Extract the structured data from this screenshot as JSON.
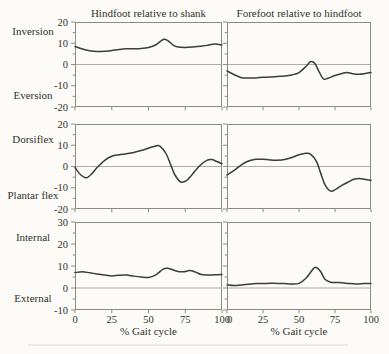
{
  "figure_title": "Foot segment kinematics across the gait cycle",
  "columns": [
    {
      "title": "Hindfoot relative to shank"
    },
    {
      "title": "Forefoot relative to hindfoot"
    }
  ],
  "rows": [
    {
      "top_label": "Inversion",
      "bottom_label": "Eversion"
    },
    {
      "top_label": "Dorsiflex",
      "bottom_label": "Plantar flex"
    },
    {
      "top_label": "Internal",
      "bottom_label": "External"
    }
  ],
  "xlabel": "% Gait cycle",
  "colors": {
    "background": "#fcfbf7",
    "axis_border": "#8d8a84",
    "zero_line": "#aeaba5",
    "series_line": "#3c3c3c",
    "text": "#33322f"
  },
  "chart_data": [
    {
      "id": "hindfoot-inversion-eversion",
      "type": "line",
      "title": "Hindfoot relative to shank — Inversion / Eversion",
      "row": 0,
      "col": 0,
      "xlabel": "% Gait cycle",
      "ylabel": "Inversion (+) / Eversion (−)",
      "xlim": [
        0,
        100
      ],
      "ylim": [
        -20,
        20
      ],
      "xticks": [
        0,
        25,
        50,
        75,
        100
      ],
      "yticks": [
        -20,
        -10,
        0,
        10,
        20
      ],
      "y_minor_step": 5,
      "show_ytick_labels": true,
      "show_xtick_labels": false,
      "points": [
        [
          0,
          8.5
        ],
        [
          5,
          7.3
        ],
        [
          10,
          6.5
        ],
        [
          15,
          6.1
        ],
        [
          20,
          6.2
        ],
        [
          25,
          6.6
        ],
        [
          30,
          7.1
        ],
        [
          35,
          7.4
        ],
        [
          40,
          7.4
        ],
        [
          45,
          7.5
        ],
        [
          50,
          8.0
        ],
        [
          55,
          9.3
        ],
        [
          60,
          11.8
        ],
        [
          63,
          11.3
        ],
        [
          67,
          9.0
        ],
        [
          70,
          8.2
        ],
        [
          75,
          8.0
        ],
        [
          80,
          8.2
        ],
        [
          85,
          8.6
        ],
        [
          90,
          9.0
        ],
        [
          95,
          9.6
        ],
        [
          100,
          9.2
        ]
      ]
    },
    {
      "id": "forefoot-inversion-eversion",
      "type": "line",
      "title": "Forefoot relative to hindfoot — Inversion / Eversion",
      "row": 0,
      "col": 1,
      "xlabel": "% Gait cycle",
      "ylabel": "Inversion (+) / Eversion (−)",
      "xlim": [
        0,
        100
      ],
      "ylim": [
        -20,
        20
      ],
      "xticks": [
        0,
        25,
        50,
        75,
        100
      ],
      "yticks": [
        -20,
        -10,
        0,
        10,
        20
      ],
      "y_minor_step": 5,
      "show_ytick_labels": false,
      "show_xtick_labels": false,
      "points": [
        [
          0,
          -3.0
        ],
        [
          5,
          -4.8
        ],
        [
          10,
          -6.2
        ],
        [
          15,
          -6.4
        ],
        [
          20,
          -6.3
        ],
        [
          25,
          -6.0
        ],
        [
          30,
          -5.9
        ],
        [
          35,
          -5.6
        ],
        [
          40,
          -5.4
        ],
        [
          45,
          -4.9
        ],
        [
          50,
          -3.8
        ],
        [
          55,
          -0.8
        ],
        [
          58,
          1.3
        ],
        [
          61,
          0.5
        ],
        [
          64,
          -3.5
        ],
        [
          67,
          -6.8
        ],
        [
          70,
          -6.5
        ],
        [
          75,
          -5.2
        ],
        [
          80,
          -4.2
        ],
        [
          83,
          -3.8
        ],
        [
          87,
          -4.3
        ],
        [
          92,
          -4.6
        ],
        [
          96,
          -4.2
        ],
        [
          100,
          -3.8
        ]
      ]
    },
    {
      "id": "hindfoot-dorsiflex-plantarflex",
      "type": "line",
      "title": "Hindfoot relative to shank — Dorsiflex / Plantar flex",
      "row": 1,
      "col": 0,
      "xlabel": "% Gait cycle",
      "ylabel": "Dorsiflex (+) / Plantar flex (−)",
      "xlim": [
        0,
        100
      ],
      "ylim": [
        -20,
        20
      ],
      "xticks": [
        0,
        25,
        50,
        75,
        100
      ],
      "yticks": [
        -20,
        -10,
        0,
        10,
        20
      ],
      "y_minor_step": 5,
      "show_ytick_labels": true,
      "show_xtick_labels": false,
      "points": [
        [
          0,
          -0.5
        ],
        [
          4,
          -4.0
        ],
        [
          8,
          -5.3
        ],
        [
          12,
          -3.0
        ],
        [
          15,
          -0.5
        ],
        [
          20,
          2.8
        ],
        [
          25,
          4.8
        ],
        [
          30,
          5.5
        ],
        [
          35,
          6.0
        ],
        [
          40,
          6.6
        ],
        [
          45,
          7.5
        ],
        [
          50,
          8.6
        ],
        [
          55,
          9.7
        ],
        [
          58,
          9.5
        ],
        [
          62,
          6.0
        ],
        [
          65,
          1.0
        ],
        [
          68,
          -4.0
        ],
        [
          72,
          -7.3
        ],
        [
          76,
          -6.5
        ],
        [
          80,
          -3.5
        ],
        [
          85,
          0.5
        ],
        [
          90,
          3.0
        ],
        [
          93,
          3.3
        ],
        [
          96,
          2.5
        ],
        [
          100,
          1.3
        ]
      ]
    },
    {
      "id": "forefoot-dorsiflex-plantarflex",
      "type": "line",
      "title": "Forefoot relative to hindfoot — Dorsiflex / Plantar flex",
      "row": 1,
      "col": 1,
      "xlabel": "% Gait cycle",
      "ylabel": "Dorsiflex (+) / Plantar flex (−)",
      "xlim": [
        0,
        100
      ],
      "ylim": [
        -20,
        20
      ],
      "xticks": [
        0,
        25,
        50,
        75,
        100
      ],
      "yticks": [
        -20,
        -10,
        0,
        10,
        20
      ],
      "y_minor_step": 5,
      "show_ytick_labels": false,
      "show_xtick_labels": false,
      "points": [
        [
          0,
          -4.0
        ],
        [
          5,
          -1.8
        ],
        [
          10,
          0.8
        ],
        [
          15,
          2.6
        ],
        [
          20,
          3.4
        ],
        [
          25,
          3.4
        ],
        [
          30,
          3.1
        ],
        [
          35,
          3.0
        ],
        [
          40,
          3.3
        ],
        [
          45,
          4.2
        ],
        [
          50,
          5.5
        ],
        [
          55,
          6.2
        ],
        [
          58,
          5.8
        ],
        [
          62,
          2.5
        ],
        [
          65,
          -3.0
        ],
        [
          68,
          -8.5
        ],
        [
          72,
          -11.6
        ],
        [
          76,
          -10.5
        ],
        [
          80,
          -8.8
        ],
        [
          85,
          -7.0
        ],
        [
          88,
          -6.0
        ],
        [
          92,
          -5.6
        ],
        [
          96,
          -6.1
        ],
        [
          100,
          -6.5
        ]
      ]
    },
    {
      "id": "hindfoot-internal-external",
      "type": "line",
      "title": "Hindfoot relative to shank — Internal / External rotation",
      "row": 2,
      "col": 0,
      "xlabel": "% Gait cycle",
      "ylabel": "Internal (+) / External (−)",
      "xlim": [
        0,
        100
      ],
      "ylim": [
        -10,
        30
      ],
      "xticks": [
        0,
        25,
        50,
        75,
        100
      ],
      "yticks": [
        -10,
        0,
        10,
        20,
        30
      ],
      "y_minor_step": 5,
      "show_ytick_labels": true,
      "show_xtick_labels": true,
      "points": [
        [
          0,
          7.0
        ],
        [
          5,
          7.4
        ],
        [
          10,
          6.9
        ],
        [
          15,
          6.4
        ],
        [
          20,
          5.9
        ],
        [
          25,
          5.5
        ],
        [
          30,
          5.8
        ],
        [
          35,
          5.9
        ],
        [
          40,
          5.4
        ],
        [
          45,
          5.0
        ],
        [
          50,
          4.8
        ],
        [
          55,
          6.0
        ],
        [
          60,
          8.6
        ],
        [
          63,
          9.0
        ],
        [
          66,
          8.4
        ],
        [
          70,
          7.5
        ],
        [
          74,
          7.4
        ],
        [
          78,
          7.9
        ],
        [
          82,
          7.2
        ],
        [
          86,
          6.1
        ],
        [
          90,
          5.9
        ],
        [
          95,
          6.0
        ],
        [
          100,
          6.1
        ]
      ]
    },
    {
      "id": "forefoot-internal-external",
      "type": "line",
      "title": "Forefoot relative to hindfoot — Internal / External rotation",
      "row": 2,
      "col": 1,
      "xlabel": "% Gait cycle",
      "ylabel": "Internal (+) / External (−)",
      "xlim": [
        0,
        100
      ],
      "ylim": [
        -10,
        30
      ],
      "xticks": [
        0,
        25,
        50,
        75,
        100
      ],
      "yticks": [
        -10,
        0,
        10,
        20,
        30
      ],
      "y_minor_step": 5,
      "show_ytick_labels": false,
      "show_xtick_labels": true,
      "points": [
        [
          0,
          1.4
        ],
        [
          5,
          1.1
        ],
        [
          10,
          1.4
        ],
        [
          15,
          1.7
        ],
        [
          20,
          2.0
        ],
        [
          25,
          2.0
        ],
        [
          30,
          2.2
        ],
        [
          35,
          2.1
        ],
        [
          40,
          2.0
        ],
        [
          45,
          1.8
        ],
        [
          50,
          2.1
        ],
        [
          55,
          4.5
        ],
        [
          60,
          8.8
        ],
        [
          62,
          9.3
        ],
        [
          65,
          7.5
        ],
        [
          68,
          4.0
        ],
        [
          72,
          2.6
        ],
        [
          76,
          2.5
        ],
        [
          80,
          2.4
        ],
        [
          85,
          2.0
        ],
        [
          90,
          1.8
        ],
        [
          95,
          2.0
        ],
        [
          100,
          2.1
        ]
      ]
    }
  ]
}
